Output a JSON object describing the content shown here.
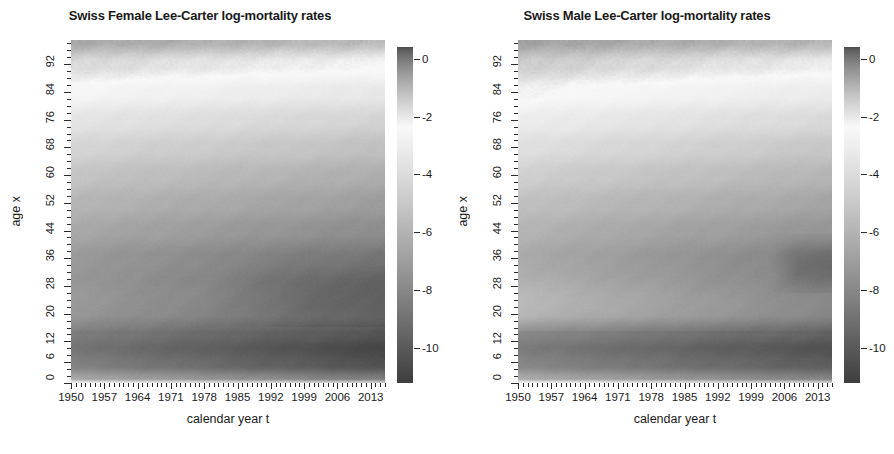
{
  "figure": {
    "width": 894,
    "height": 454,
    "background": "#ffffff",
    "colormap": "grayscale-terrain",
    "panel_count": 2
  },
  "chart_data": [
    {
      "type": "heatmap",
      "title": "Swiss Female Lee-Carter log-mortality rates",
      "xlabel": "calendar year t",
      "ylabel": "age x",
      "xlim": [
        1950,
        2016
      ],
      "ylim": [
        0,
        99
      ],
      "xticks": [
        1950,
        1957,
        1964,
        1971,
        1978,
        1985,
        1992,
        1999,
        2006,
        2013
      ],
      "yticks": [
        0,
        6,
        12,
        20,
        28,
        36,
        44,
        52,
        60,
        68,
        76,
        84,
        92
      ],
      "x": "calendar years 1950..2016 (annual)",
      "y": "ages 0..99 (single year)",
      "z_label": "log-mortality rate log(m(t,x))",
      "zlim": [
        -11.2,
        0.4
      ],
      "colorbar": {
        "ticks": [
          0,
          -2,
          -4,
          -6,
          -8,
          -10
        ],
        "position": "right",
        "orientation": "vertical"
      },
      "grid": false,
      "legend": "none",
      "z_profile_notes": {
        "description": "Lee-Carter fitted surface; dark = extreme values at both ends of the grayscale",
        "age_0_infant": -4.5,
        "age_1_to_5": -7.0,
        "age_6_to_14_minimum_1950": -8.6,
        "age_6_to_14_minimum_2016": -10.6,
        "age_20_to_35_1950": -7.6,
        "age_20_to_35_2016": -9.2,
        "age_45_1950": -5.6,
        "age_45_2016": -6.8,
        "age_65_1950": -4.1,
        "age_65_2016": -5.3,
        "age_85_1950": -2.2,
        "age_85_2016": -3.1,
        "age_99_1950": -0.55,
        "age_99_2016": -0.95
      },
      "surface": {
        "age_breaks": [
          0,
          1,
          5,
          10,
          14,
          20,
          28,
          36,
          44,
          52,
          60,
          68,
          76,
          84,
          92,
          99
        ],
        "z_1950": [
          -4.4,
          -6.55,
          -8.15,
          -8.7,
          -8.35,
          -7.55,
          -7.45,
          -7.1,
          -6.4,
          -5.75,
          -5.05,
          -4.25,
          -3.4,
          -2.45,
          -1.55,
          -0.6
        ],
        "z_2016": [
          -6.1,
          -8.5,
          -10.35,
          -10.8,
          -10.2,
          -9.25,
          -9.05,
          -8.55,
          -7.7,
          -6.95,
          -6.2,
          -5.3,
          -4.35,
          -3.3,
          -2.2,
          -1.0
        ]
      }
    },
    {
      "type": "heatmap",
      "title": "Swiss Male Lee-Carter log-mortality rates",
      "xlabel": "calendar year t",
      "ylabel": "age x",
      "xlim": [
        1950,
        2016
      ],
      "ylim": [
        0,
        99
      ],
      "xticks": [
        1950,
        1957,
        1964,
        1971,
        1978,
        1985,
        1992,
        1999,
        2006,
        2013
      ],
      "yticks": [
        0,
        6,
        12,
        20,
        28,
        36,
        44,
        52,
        60,
        68,
        76,
        84,
        92
      ],
      "x": "calendar years 1950..2016 (annual)",
      "y": "ages 0..99 (single year)",
      "z_label": "log-mortality rate log(m(t,x))",
      "zlim": [
        -11.2,
        0.4
      ],
      "colorbar": {
        "ticks": [
          0,
          -2,
          -4,
          -6,
          -8,
          -10
        ],
        "position": "right",
        "orientation": "vertical"
      },
      "grid": false,
      "legend": "none",
      "z_profile_notes": {
        "description": "Male surface: lighter mid-age band, accident hump at ages 18-30, dark low-mortality patch at ages 28-40 after 2006",
        "age_0_infant": -4.3,
        "age_1_to_5": -6.8,
        "age_6_to_14_minimum_1950": -8.3,
        "age_6_to_14_minimum_2016": -10.2,
        "age_20_to_35_1950": -6.6,
        "age_20_to_35_2016": -8.4,
        "age_45_1950": -5.1,
        "age_45_2016": -6.4,
        "age_65_1950": -3.5,
        "age_65_2016": -4.9,
        "age_85_1950": -1.9,
        "age_85_2016": -2.8,
        "age_99_1950": -0.45,
        "age_99_2016": -0.85
      },
      "surface": {
        "age_breaks": [
          0,
          1,
          5,
          10,
          14,
          20,
          28,
          36,
          44,
          52,
          60,
          68,
          76,
          84,
          92,
          99
        ],
        "z_1950": [
          -4.2,
          -6.35,
          -7.9,
          -8.4,
          -7.85,
          -6.55,
          -6.5,
          -6.35,
          -5.85,
          -5.25,
          -4.5,
          -3.7,
          -2.95,
          -2.1,
          -1.3,
          -0.5
        ],
        "z_2016": [
          -5.95,
          -8.25,
          -9.8,
          -10.3,
          -9.6,
          -8.35,
          -8.4,
          -8.2,
          -7.35,
          -6.6,
          -5.85,
          -5.0,
          -4.05,
          -3.05,
          -2.0,
          -0.9
        ]
      }
    }
  ],
  "panels": [
    {
      "id": "female",
      "title": "Swiss Female Lee-Carter log-mortality rates",
      "xtitle": "calendar year t",
      "ytitle": "age x",
      "xticklabels": [
        "1950",
        "1957",
        "1964",
        "1971",
        "1978",
        "1985",
        "1992",
        "1999",
        "2006",
        "2013"
      ],
      "yticklabels": [
        "0",
        "6",
        "12",
        "20",
        "28",
        "36",
        "44",
        "52",
        "60",
        "68",
        "76",
        "84",
        "92"
      ],
      "cbarticklabels": [
        "0",
        "-2",
        "-4",
        "-6",
        "-8",
        "-10"
      ]
    },
    {
      "id": "male",
      "title": "Swiss Male Lee-Carter log-mortality rates",
      "xtitle": "calendar year t",
      "ytitle": "age x",
      "xticklabels": [
        "1950",
        "1957",
        "1964",
        "1971",
        "1978",
        "1985",
        "1992",
        "1999",
        "2006",
        "2013"
      ],
      "yticklabels": [
        "0",
        "6",
        "12",
        "20",
        "28",
        "36",
        "44",
        "52",
        "60",
        "68",
        "76",
        "84",
        "92"
      ],
      "cbarticklabels": [
        "0",
        "-2",
        "-4",
        "-6",
        "-8",
        "-10"
      ]
    }
  ]
}
